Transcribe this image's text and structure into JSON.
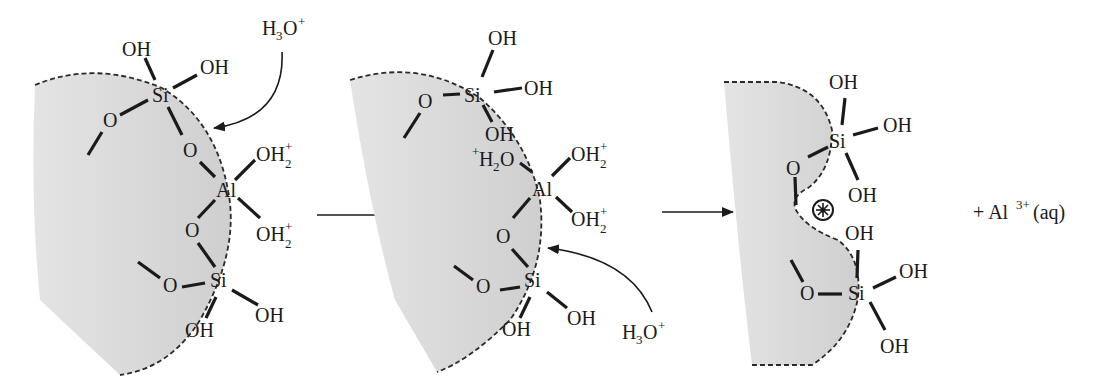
{
  "diagram": {
    "colors": {
      "surface_fill": "#d8d8d8",
      "ink": "#1a1a1a",
      "background": "#ffffff"
    },
    "panels": [
      {
        "id": "panel-1",
        "atoms": {
          "si_top": "Si",
          "oh_top_a": "OH",
          "oh_top_b": "OH",
          "o_left_top": "O",
          "o_bridge_top": "O",
          "al": "Al",
          "oh2_a": "OH",
          "oh2_b": "OH",
          "o_bridge_bottom": "O",
          "si_bottom": "Si",
          "o_left_bottom": "O",
          "oh_bottom_a": "OH",
          "oh_bottom_b": "OH"
        },
        "charge_sub": "2",
        "charge_sup": "+",
        "reagent": {
          "base": "H",
          "sub": "3",
          "tail": "O",
          "sup": "+"
        }
      },
      {
        "id": "panel-2",
        "atoms": {
          "si_top": "Si",
          "oh_top_a": "OH",
          "oh_top_b": "OH",
          "oh_top_c": "OH",
          "o_left_top": "O",
          "h2o_prefix": "+",
          "h2o_base": "H",
          "h2o_sub": "2",
          "h2o_tail": "O",
          "al": "Al",
          "oh2_a": "OH",
          "oh2_b": "OH",
          "o_bridge_bottom": "O",
          "si_bottom": "Si",
          "o_left_bottom": "O",
          "oh_bottom_a": "OH",
          "oh_bottom_b": "OH"
        },
        "charge_sub": "2",
        "charge_sup": "+",
        "reagent": {
          "base": "H",
          "sub": "3",
          "tail": "O",
          "sup": "+"
        }
      },
      {
        "id": "panel-3",
        "atoms": {
          "si_top": "Si",
          "oh_top_a": "OH",
          "oh_top_b": "OH",
          "oh_top_c": "OH",
          "o_left_top": "O",
          "si_bottom": "Si",
          "oh_bottom_a": "OH",
          "oh_bottom_b": "OH",
          "oh_bottom_c": "OH",
          "o_left_bottom": "O"
        },
        "vacancy_symbol": "⊛",
        "product": {
          "prefix": "+ Al",
          "sup": "3+",
          "tail": "(aq)"
        }
      }
    ],
    "arrows": [
      "reaction-arrow-1",
      "reaction-arrow-2"
    ]
  }
}
